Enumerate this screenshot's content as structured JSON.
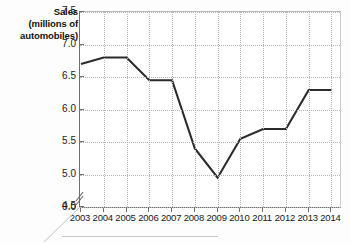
{
  "axis_titles": {
    "y_line1": "Sales",
    "y_line2": "(millions of",
    "y_line3": "automobiles)"
  },
  "colors": {
    "line": "#2b2b2b",
    "axis": "#6f6f6f",
    "grid": "#b5b5b5",
    "text": "#1a1a1a",
    "background": "#ffffff"
  },
  "chart_data": {
    "type": "line",
    "title": "",
    "subtitle": "",
    "xlabel": "",
    "ylabel": "Sales (millions of automobiles)",
    "x": [
      "2003",
      "2004",
      "2005",
      "2006",
      "2007",
      "2008",
      "2009",
      "2010",
      "2011",
      "2012",
      "2013",
      "2014"
    ],
    "categories": [
      "2003",
      "2004",
      "2005",
      "2006",
      "2007",
      "2008",
      "2009",
      "2010",
      "2011",
      "2012",
      "2013",
      "2014"
    ],
    "values": [
      6.7,
      6.8,
      6.8,
      6.45,
      6.45,
      5.4,
      4.95,
      5.55,
      5.7,
      5.7,
      6.3,
      6.3
    ],
    "series": [
      {
        "name": "Sales",
        "values": [
          6.7,
          6.8,
          6.8,
          6.45,
          6.45,
          5.4,
          4.95,
          5.55,
          5.7,
          5.7,
          6.3,
          6.3
        ]
      }
    ],
    "ylim": [
      4.5,
      7.5
    ],
    "yticks": [
      "7.5",
      "7.0",
      "6.5",
      "6.0",
      "5.5",
      "5.0",
      "4.5",
      "0.0"
    ],
    "ytick_values": [
      7.5,
      7.0,
      6.5,
      6.0,
      5.5,
      5.0,
      4.5
    ],
    "y_axis_break": true,
    "y_axis_break_label": "0.0",
    "xticks": [
      "2003",
      "2004",
      "2005",
      "2006",
      "2007",
      "2008",
      "2009",
      "2010",
      "2011",
      "2012",
      "2013",
      "2014"
    ],
    "grid": true,
    "grid_style": "dotted",
    "legend": false,
    "legend_position": "none",
    "annotations": []
  }
}
